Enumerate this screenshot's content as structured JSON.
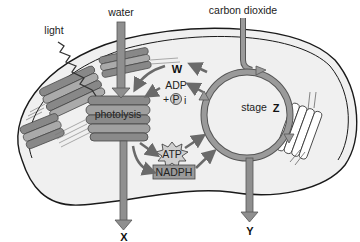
{
  "diagram": {
    "labels": {
      "light": "light",
      "water": "water",
      "carbon_dioxide": "carbon dioxide",
      "w": "W",
      "adp": "ADP",
      "plus": "+",
      "pi_p": "P",
      "pi_i": "i",
      "photolysis": "photolysis",
      "atp": "ATP",
      "nadph": "NADPH",
      "stage": "stage",
      "z": "Z",
      "x": "X",
      "y": "Y"
    },
    "colors": {
      "background": "#ffffff",
      "stroma": "#f0f0f0",
      "outline": "#1a1a1a",
      "arrow_fill": "#8f8f8f",
      "arrow_stroke": "#555555",
      "thylakoid_dark": "#6e6e6e",
      "thylakoid_light": "#a8a8a8",
      "nadph_box": "#9a9a9a"
    }
  }
}
